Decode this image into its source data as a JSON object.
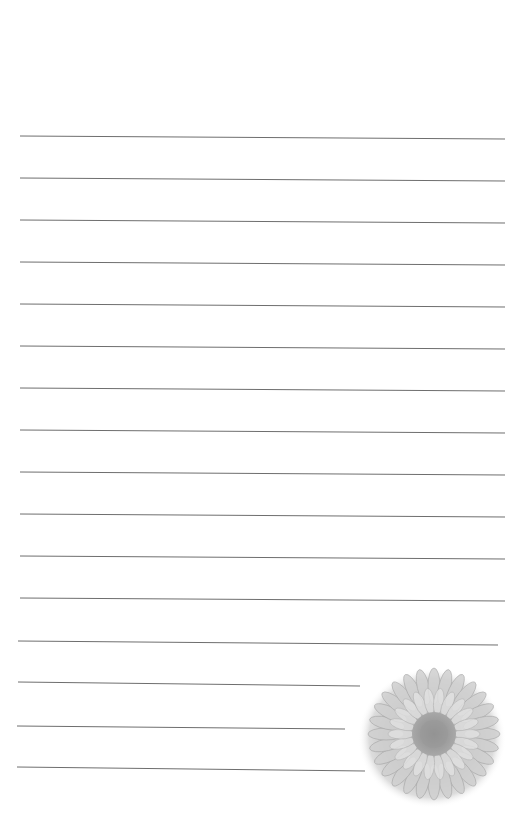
{
  "document": {
    "type": "lined-notepaper",
    "line_color": "#6e6e6e",
    "background": "#ffffff",
    "lines": [
      {
        "x1": 20,
        "y1": 136,
        "x2": 505,
        "y2": 139
      },
      {
        "x1": 20,
        "y1": 178,
        "x2": 505,
        "y2": 181
      },
      {
        "x1": 20,
        "y1": 220,
        "x2": 505,
        "y2": 223
      },
      {
        "x1": 20,
        "y1": 262,
        "x2": 505,
        "y2": 265
      },
      {
        "x1": 20,
        "y1": 304,
        "x2": 505,
        "y2": 307
      },
      {
        "x1": 20,
        "y1": 346,
        "x2": 505,
        "y2": 349
      },
      {
        "x1": 20,
        "y1": 388,
        "x2": 505,
        "y2": 391
      },
      {
        "x1": 20,
        "y1": 430,
        "x2": 505,
        "y2": 433
      },
      {
        "x1": 20,
        "y1": 472,
        "x2": 505,
        "y2": 475
      },
      {
        "x1": 20,
        "y1": 514,
        "x2": 505,
        "y2": 517
      },
      {
        "x1": 20,
        "y1": 556,
        "x2": 505,
        "y2": 559
      },
      {
        "x1": 20,
        "y1": 598,
        "x2": 505,
        "y2": 601
      },
      {
        "x1": 18,
        "y1": 641,
        "x2": 498,
        "y2": 645
      },
      {
        "x1": 18,
        "y1": 682,
        "x2": 360,
        "y2": 686
      },
      {
        "x1": 17,
        "y1": 726,
        "x2": 345,
        "y2": 729
      },
      {
        "x1": 17,
        "y1": 767,
        "x2": 365,
        "y2": 771
      }
    ],
    "decoration": {
      "icon": "chrysanthemum-flower",
      "color": "#b8b8b8"
    }
  }
}
